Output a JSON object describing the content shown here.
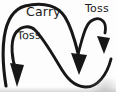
{
  "diagram": {
    "type": "hand-path-arrow-diagram",
    "background_color": "#fdfdfd",
    "ink_color": "#171717",
    "text_color": "#1b1b1b",
    "labels": {
      "carry": "Carry",
      "toss_left": "Toss",
      "toss_right": "Toss"
    },
    "arrows": [
      {
        "name": "toss-left-arrow",
        "label": "Toss",
        "head": "down, bottom-left"
      },
      {
        "name": "carry-arrow",
        "label": "Carry",
        "head": "down, bottom-middle"
      },
      {
        "name": "toss-right-arrow",
        "label": "Toss",
        "head": "down, right"
      }
    ]
  }
}
